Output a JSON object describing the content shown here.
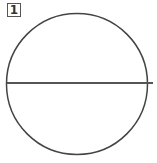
{
  "figure": {
    "label": "1",
    "shape": "circle-with-diameter",
    "circle": {
      "cx": 77,
      "cy": 84,
      "r": 70.5,
      "stroke": "#444444"
    },
    "diameter": {
      "x1": 7,
      "y1": 83,
      "x2": 153,
      "y2": 83,
      "stroke": "#555555"
    }
  }
}
